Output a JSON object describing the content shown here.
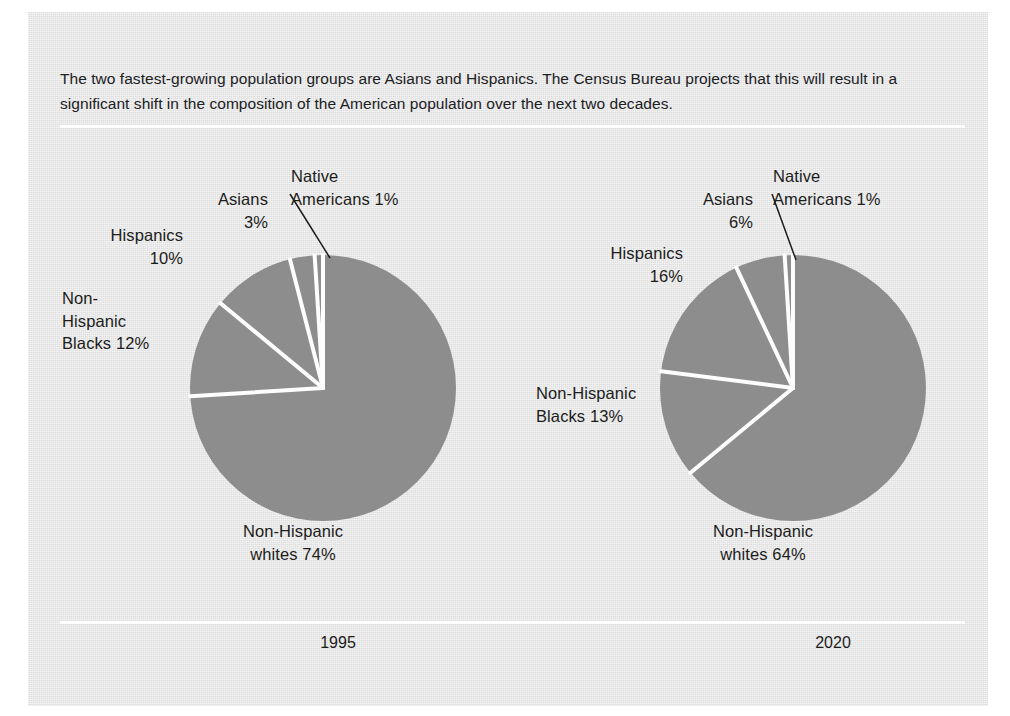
{
  "caption": "The two fastest-growing population groups are Asians and Hispanics. The Census Bureau projects that this will result in a significant shift in the composition of the American population over the next two decades.",
  "colors": {
    "card_background": "#e4e4e4",
    "pie_fill": "#8d8d8d",
    "separator": "#fdfdfd",
    "rule": "#fdfdfd",
    "text": "#1c1c1b",
    "leader_line": "#1c1c1b"
  },
  "panels": [
    {
      "year": "1995",
      "labels": {
        "asians": "Asians\n3%",
        "native_americans": "Native\nAmericans  1%",
        "hispanics": "Hispanics\n10%",
        "blacks": "Non-\nHispanic\nBlacks  12%",
        "whites": "Non-Hispanic\nwhites  74%"
      }
    },
    {
      "year": "2020",
      "labels": {
        "asians": "Asians\n6%",
        "native_americans": "Native\nAmericans  1%",
        "hispanics": "Hispanics\n16%",
        "blacks": "Non-Hispanic\nBlacks  13%",
        "whites": "Non-Hispanic\nwhites  64%"
      }
    }
  ],
  "chart_data": [
    {
      "type": "pie",
      "title": "1995",
      "labels": [
        "Native Americans",
        "Asians",
        "Hispanics",
        "Non-Hispanic Blacks",
        "Non-Hispanic whites"
      ],
      "values": [
        1,
        3,
        10,
        12,
        74
      ],
      "value_suffix": "%",
      "legend": "labels placed around pie with leader line for Native Americans",
      "colors": [
        "#8d8d8d",
        "#8d8d8d",
        "#8d8d8d",
        "#8d8d8d",
        "#8d8d8d"
      ],
      "start_angle_deg": 0,
      "direction": "counterclockwise"
    },
    {
      "type": "pie",
      "title": "2020",
      "labels": [
        "Native Americans",
        "Asians",
        "Hispanics",
        "Non-Hispanic Blacks",
        "Non-Hispanic whites"
      ],
      "values": [
        1,
        6,
        16,
        13,
        64
      ],
      "value_suffix": "%",
      "legend": "labels placed around pie with leader line for Native Americans",
      "colors": [
        "#8d8d8d",
        "#8d8d8d",
        "#8d8d8d",
        "#8d8d8d",
        "#8d8d8d"
      ],
      "start_angle_deg": 0,
      "direction": "counterclockwise"
    }
  ]
}
